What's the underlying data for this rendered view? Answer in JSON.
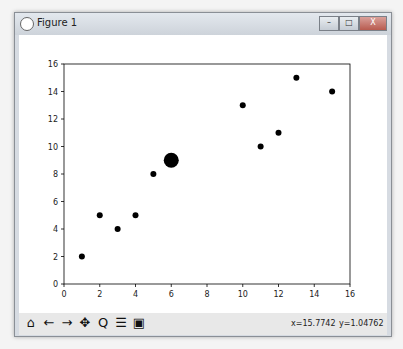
{
  "window": {
    "title": "Figure 1",
    "buttons": {
      "minimize": "–",
      "maximize": "□",
      "close": "X"
    }
  },
  "toolbar": {
    "icons": [
      {
        "name": "home-icon",
        "glyph": "⌂"
      },
      {
        "name": "back-icon",
        "glyph": "←"
      },
      {
        "name": "forward-icon",
        "glyph": "→"
      },
      {
        "name": "pan-icon",
        "glyph": "✥"
      },
      {
        "name": "zoom-icon",
        "glyph": "Q"
      },
      {
        "name": "configure-subplots-icon",
        "glyph": "☰"
      },
      {
        "name": "save-icon",
        "glyph": "▣"
      }
    ],
    "x_coord": "x=15.7742",
    "y_coord": "y=1.04762"
  },
  "chart_data": {
    "type": "scatter",
    "title": "",
    "xlabel": "",
    "ylabel": "",
    "xlim": [
      0,
      16
    ],
    "ylim": [
      0,
      16
    ],
    "xticks": [
      0,
      2,
      4,
      6,
      8,
      10,
      12,
      14,
      16
    ],
    "yticks": [
      0,
      2,
      4,
      6,
      8,
      10,
      12,
      14,
      16
    ],
    "grid": false,
    "points": [
      {
        "x": 1,
        "y": 2,
        "size": "small"
      },
      {
        "x": 2,
        "y": 5,
        "size": "small"
      },
      {
        "x": 3,
        "y": 4,
        "size": "small"
      },
      {
        "x": 4,
        "y": 5,
        "size": "small"
      },
      {
        "x": 5,
        "y": 8,
        "size": "small"
      },
      {
        "x": 6,
        "y": 9,
        "size": "large"
      },
      {
        "x": 10,
        "y": 13,
        "size": "small"
      },
      {
        "x": 11,
        "y": 10,
        "size": "small"
      },
      {
        "x": 12,
        "y": 11,
        "size": "small"
      },
      {
        "x": 13,
        "y": 15,
        "size": "small"
      },
      {
        "x": 15,
        "y": 14,
        "size": "small"
      }
    ],
    "color": "#000000"
  }
}
